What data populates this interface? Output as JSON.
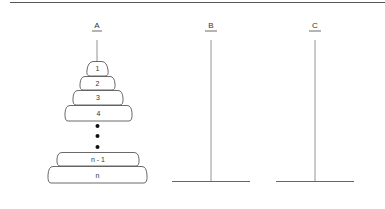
{
  "diagram": {
    "pegs": [
      {
        "label": "A",
        "x": 97
      },
      {
        "label": "B",
        "x": 211
      },
      {
        "label": "C",
        "x": 315
      }
    ],
    "disks": [
      {
        "label": "1",
        "left": 87,
        "right": 108,
        "top": 61,
        "bottom": 76
      },
      {
        "label": "2",
        "left": 80,
        "right": 115,
        "top": 76,
        "bottom": 90
      },
      {
        "label": "3",
        "left": 73,
        "right": 123,
        "top": 90,
        "bottom": 105
      },
      {
        "label": "4",
        "left": 65,
        "right": 132,
        "top": 105,
        "bottom": 121
      },
      {
        "label": "n - 1",
        "left": 57,
        "right": 139,
        "top": 152,
        "bottom": 166
      },
      {
        "label": "n",
        "left": 48,
        "right": 147,
        "top": 166,
        "bottom": 183
      }
    ],
    "ellipsis_dots": [
      126,
      136,
      147
    ],
    "colors": {
      "stroke": "#444444",
      "text": "#333333",
      "top_rule": "#555555"
    }
  }
}
